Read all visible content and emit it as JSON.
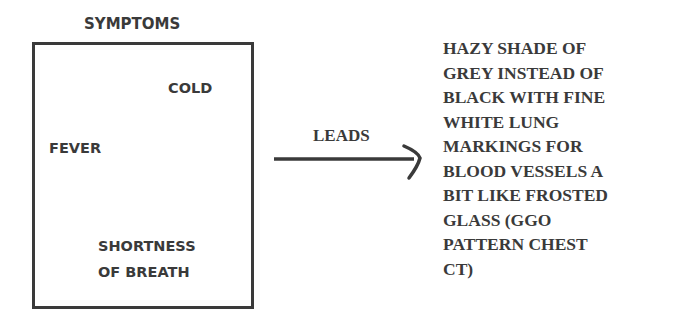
{
  "symptoms": {
    "title": "SYMPTOMS",
    "items": [
      "COLD",
      "FEVER",
      "SHORTNESS",
      "OF BREATH"
    ]
  },
  "arrow": {
    "label": "LEADS"
  },
  "result": {
    "lines": [
      "HAZY SHADE OF",
      "GREY INSTEAD OF",
      "BLACK WITH FINE",
      "WHITE LUNG",
      "MARKINGS FOR",
      "BLOOD VESSELS A",
      "BIT LIKE FROSTED",
      "GLASS (GGO",
      "PATTERN CHEST",
      "CT)"
    ]
  }
}
